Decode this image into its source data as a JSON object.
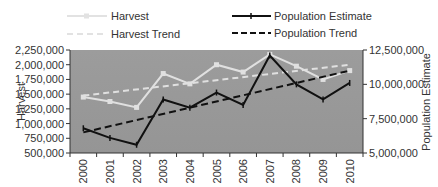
{
  "chart_data": {
    "type": "line",
    "title": "",
    "xlabel": "",
    "categories": [
      "2000",
      "2001",
      "2002",
      "2003",
      "2004",
      "2005",
      "2006",
      "2007",
      "2008",
      "2009",
      "2010"
    ],
    "series": [
      {
        "name": "Harvest",
        "axis": "left",
        "style": "solid-light-with-square-markers",
        "color": "#e0e0e0",
        "values": [
          1450000,
          1375000,
          1275000,
          1850000,
          1675000,
          2000000,
          1875000,
          2175000,
          1975000,
          1750000,
          1900000
        ]
      },
      {
        "name": "Harvest Trend",
        "axis": "left",
        "style": "dashed-light",
        "color": "#e0e0e0",
        "values": [
          1475000,
          1525000,
          1575000,
          1625000,
          1675000,
          1725000,
          1775000,
          1825000,
          1875000,
          1925000,
          2000000
        ]
      },
      {
        "name": "Population Estimate",
        "axis": "right",
        "style": "solid-black-with-dash-markers",
        "color": "#111111",
        "values": [
          6800000,
          6100000,
          5600000,
          8900000,
          8300000,
          9400000,
          8500000,
          12100000,
          10000000,
          8900000,
          10100000
        ]
      },
      {
        "name": "Population Trend",
        "axis": "right",
        "style": "dashed-black",
        "color": "#111111",
        "values": [
          6500000,
          6950000,
          7400000,
          7850000,
          8300000,
          8750000,
          9200000,
          9650000,
          10100000,
          10550000,
          11000000
        ]
      }
    ],
    "left_axis": {
      "label": "Harvest",
      "ylim": [
        500000,
        2250000
      ],
      "ticks": [
        "500,000",
        "750,000",
        "1,000,000",
        "1,250,000",
        "1,500,000",
        "1,750,000",
        "2,000,000",
        "2,250,000"
      ]
    },
    "right_axis": {
      "label": "Population Estimate",
      "ylim": [
        5000000,
        12500000
      ],
      "ticks": [
        "5,000,000",
        "7,500,000",
        "10,000,000",
        "12,500,000"
      ]
    },
    "legend": {
      "position": "top",
      "entries": [
        "Harvest",
        "Harvest Trend",
        "Population Estimate",
        "Population Trend"
      ]
    },
    "grid": false,
    "plot_background": "#999999"
  }
}
